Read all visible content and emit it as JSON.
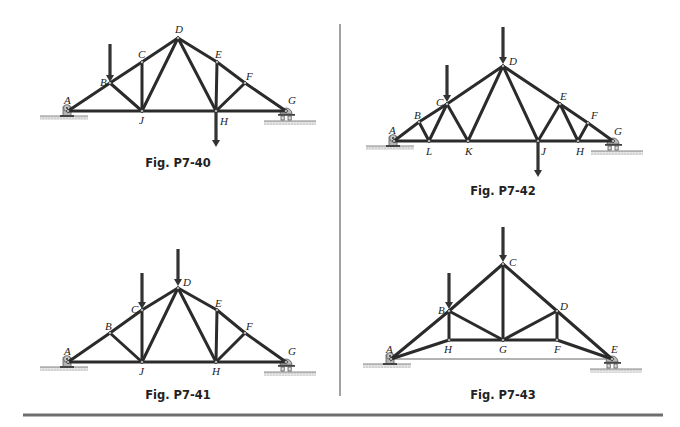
{
  "figures": [
    {
      "id": "fig-p7-40",
      "caption": "Fig. P7-40",
      "nodes": {
        "A": [
          68,
          111
        ],
        "B": [
          110,
          83
        ],
        "C": [
          142,
          62
        ],
        "D": [
          178,
          38
        ],
        "E": [
          217,
          62
        ],
        "F": [
          245,
          83
        ],
        "G": [
          286,
          111
        ],
        "J": [
          142,
          111
        ],
        "H": [
          216,
          111
        ]
      },
      "members": [
        [
          "A",
          "B"
        ],
        [
          "B",
          "C"
        ],
        [
          "C",
          "D"
        ],
        [
          "D",
          "E"
        ],
        [
          "E",
          "F"
        ],
        [
          "F",
          "G"
        ],
        [
          "A",
          "J"
        ],
        [
          "J",
          "H"
        ],
        [
          "H",
          "G"
        ],
        [
          "B",
          "J"
        ],
        [
          "C",
          "J"
        ],
        [
          "D",
          "J"
        ],
        [
          "D",
          "H"
        ],
        [
          "E",
          "H"
        ],
        [
          "F",
          "H"
        ]
      ],
      "loads": [
        {
          "at": "B",
          "dir": "down",
          "from": [
            110,
            44
          ],
          "to": [
            110,
            82
          ]
        },
        {
          "at": "H",
          "dir": "down",
          "from": [
            216,
            112
          ],
          "to": [
            216,
            147
          ]
        }
      ],
      "labels": [
        {
          "t": "A",
          "x": 64,
          "y": 104
        },
        {
          "t": "B",
          "x": 100,
          "y": 86
        },
        {
          "t": "C",
          "x": 138,
          "y": 58
        },
        {
          "t": "D",
          "x": 175,
          "y": 33
        },
        {
          "t": "E",
          "x": 215,
          "y": 58
        },
        {
          "t": "F",
          "x": 246,
          "y": 80
        },
        {
          "t": "G",
          "x": 288,
          "y": 104
        },
        {
          "t": "J",
          "x": 139,
          "y": 124
        },
        {
          "t": "H",
          "x": 220,
          "y": 125
        }
      ],
      "pin_support": [
        68,
        111
      ],
      "roller_support": [
        286,
        111
      ],
      "caption_pos": [
        178,
        167
      ]
    },
    {
      "id": "fig-p7-42",
      "caption": "Fig. P7-42",
      "nodes": {
        "A": [
          394,
          141
        ],
        "B": [
          419,
          122
        ],
        "C": [
          447,
          104
        ],
        "D": [
          503,
          66
        ],
        "E": [
          560,
          104
        ],
        "F": [
          588,
          123
        ],
        "G": [
          613,
          141
        ],
        "L": [
          429,
          141
        ],
        "K": [
          468,
          141
        ],
        "J": [
          538,
          141
        ],
        "H": [
          578,
          141
        ]
      },
      "members": [
        [
          "A",
          "B"
        ],
        [
          "B",
          "C"
        ],
        [
          "C",
          "D"
        ],
        [
          "D",
          "E"
        ],
        [
          "E",
          "F"
        ],
        [
          "F",
          "G"
        ],
        [
          "A",
          "L"
        ],
        [
          "L",
          "K"
        ],
        [
          "K",
          "J"
        ],
        [
          "J",
          "H"
        ],
        [
          "H",
          "G"
        ],
        [
          "B",
          "L"
        ],
        [
          "C",
          "L"
        ],
        [
          "C",
          "K"
        ],
        [
          "D",
          "K"
        ],
        [
          "D",
          "J"
        ],
        [
          "E",
          "J"
        ],
        [
          "E",
          "H"
        ],
        [
          "F",
          "H"
        ]
      ],
      "loads": [
        {
          "at": "C",
          "dir": "down",
          "from": [
            447,
            65
          ],
          "to": [
            447,
            102
          ]
        },
        {
          "at": "D",
          "dir": "down",
          "from": [
            503,
            27
          ],
          "to": [
            503,
            64
          ]
        },
        {
          "at": "J",
          "dir": "down",
          "from": [
            538,
            142
          ],
          "to": [
            538,
            177
          ]
        }
      ],
      "labels": [
        {
          "t": "A",
          "x": 389,
          "y": 134
        },
        {
          "t": "B",
          "x": 414,
          "y": 119
        },
        {
          "t": "C",
          "x": 436,
          "y": 106
        },
        {
          "t": "D",
          "x": 509,
          "y": 65
        },
        {
          "t": "E",
          "x": 560,
          "y": 100
        },
        {
          "t": "F",
          "x": 591,
          "y": 119
        },
        {
          "t": "G",
          "x": 614,
          "y": 135
        },
        {
          "t": "L",
          "x": 426,
          "y": 155
        },
        {
          "t": "K",
          "x": 465,
          "y": 155
        },
        {
          "t": "J",
          "x": 541,
          "y": 155
        },
        {
          "t": "H",
          "x": 576,
          "y": 155
        }
      ],
      "pin_support": [
        394,
        141
      ],
      "roller_support": [
        613,
        141
      ],
      "caption_pos": [
        503,
        195
      ]
    },
    {
      "id": "fig-p7-41",
      "caption": "Fig. P7-41",
      "nodes": {
        "A": [
          68,
          362
        ],
        "B": [
          110,
          333
        ],
        "C": [
          142,
          310
        ],
        "D": [
          178,
          288
        ],
        "E": [
          217,
          310
        ],
        "F": [
          245,
          333
        ],
        "G": [
          286,
          362
        ],
        "J": [
          142,
          362
        ],
        "H": [
          216,
          362
        ]
      },
      "members": [
        [
          "A",
          "B"
        ],
        [
          "B",
          "C"
        ],
        [
          "C",
          "D"
        ],
        [
          "D",
          "E"
        ],
        [
          "E",
          "F"
        ],
        [
          "F",
          "G"
        ],
        [
          "A",
          "J"
        ],
        [
          "J",
          "H"
        ],
        [
          "H",
          "G"
        ],
        [
          "B",
          "J"
        ],
        [
          "C",
          "J"
        ],
        [
          "D",
          "J"
        ],
        [
          "D",
          "H"
        ],
        [
          "E",
          "H"
        ],
        [
          "F",
          "H"
        ]
      ],
      "loads": [
        {
          "at": "C",
          "dir": "down",
          "from": [
            142,
            273
          ],
          "to": [
            142,
            309
          ]
        },
        {
          "at": "D",
          "dir": "down",
          "from": [
            178,
            249
          ],
          "to": [
            178,
            286
          ]
        }
      ],
      "labels": [
        {
          "t": "A",
          "x": 64,
          "y": 355
        },
        {
          "t": "B",
          "x": 105,
          "y": 330
        },
        {
          "t": "C",
          "x": 131,
          "y": 313
        },
        {
          "t": "D",
          "x": 183,
          "y": 286
        },
        {
          "t": "E",
          "x": 215,
          "y": 307
        },
        {
          "t": "F",
          "x": 246,
          "y": 330
        },
        {
          "t": "G",
          "x": 288,
          "y": 355
        },
        {
          "t": "J",
          "x": 139,
          "y": 375
        },
        {
          "t": "H",
          "x": 212,
          "y": 375
        }
      ],
      "pin_support": [
        68,
        362
      ],
      "roller_support": [
        286,
        362
      ],
      "caption_pos": [
        178,
        399
      ]
    },
    {
      "id": "fig-p7-43",
      "caption": "Fig. P7-43",
      "nodes": {
        "A": [
          391,
          359
        ],
        "B": [
          449,
          311
        ],
        "C": [
          503,
          264
        ],
        "D": [
          557,
          311
        ],
        "E": [
          612,
          359
        ],
        "H": [
          449,
          340
        ],
        "G": [
          503,
          340
        ],
        "F": [
          557,
          340
        ]
      },
      "members": [
        [
          "A",
          "B"
        ],
        [
          "B",
          "C"
        ],
        [
          "C",
          "D"
        ],
        [
          "D",
          "E"
        ],
        [
          "A",
          "H"
        ],
        [
          "H",
          "G"
        ],
        [
          "G",
          "F"
        ],
        [
          "F",
          "E"
        ],
        [
          "B",
          "H"
        ],
        [
          "B",
          "G"
        ],
        [
          "C",
          "G"
        ],
        [
          "D",
          "G"
        ],
        [
          "D",
          "F"
        ]
      ],
      "thin_members": [
        [
          "A",
          "E"
        ]
      ],
      "loads": [
        {
          "at": "B",
          "dir": "down",
          "from": [
            449,
            273
          ],
          "to": [
            449,
            309
          ]
        },
        {
          "at": "C",
          "dir": "down",
          "from": [
            503,
            227
          ],
          "to": [
            503,
            262
          ]
        }
      ],
      "labels": [
        {
          "t": "A",
          "x": 386,
          "y": 353
        },
        {
          "t": "B",
          "x": 438,
          "y": 314
        },
        {
          "t": "C",
          "x": 509,
          "y": 266
        },
        {
          "t": "D",
          "x": 560,
          "y": 310
        },
        {
          "t": "E",
          "x": 611,
          "y": 353
        },
        {
          "t": "H",
          "x": 444,
          "y": 353
        },
        {
          "t": "G",
          "x": 499,
          "y": 353
        },
        {
          "t": "F",
          "x": 554,
          "y": 353
        }
      ],
      "pin_support": [
        391,
        359
      ],
      "roller_support": [
        612,
        359
      ],
      "caption_pos": [
        503,
        399
      ]
    }
  ],
  "layout": {
    "vertical_divider": {
      "x": 340,
      "y1": 24,
      "y2": 396
    },
    "bottom_rule": {
      "y": 415,
      "x1": 23,
      "x2": 663
    }
  },
  "colors": {
    "member": "#2b2b2b",
    "support": "#a8a8a8",
    "divider": "#7a7a7a"
  }
}
